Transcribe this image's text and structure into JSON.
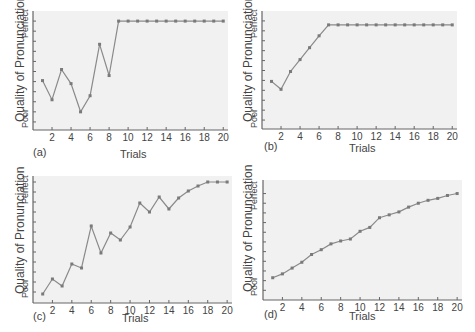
{
  "figure": {
    "ylabel": "Quality of Pronunciation",
    "ytop_label": "Perfect",
    "ybottom_label": "Poor",
    "xlabel": "Trials",
    "xtick_labels": [
      "2",
      "4",
      "6",
      "8",
      "10",
      "12",
      "14",
      "16",
      "18",
      "20"
    ],
    "colors": {
      "plot_bg": "#f1f1f1",
      "line": "#8a8a8a",
      "marker": "#7a7a7a",
      "axis": "#666666"
    }
  },
  "panels": [
    {
      "tag": "(a)"
    },
    {
      "tag": "(b)"
    },
    {
      "tag": "(c)"
    },
    {
      "tag": "(d)"
    }
  ],
  "chart_data": [
    {
      "type": "line",
      "title": "(a)",
      "xlabel": "Trials",
      "ylabel": "Quality of Pronunciation (Poor → Perfect)",
      "x": [
        1,
        2,
        3,
        4,
        5,
        6,
        7,
        8,
        9,
        10,
        11,
        12,
        13,
        14,
        15,
        16,
        17,
        18,
        19,
        20
      ],
      "values": [
        4.1,
        2.2,
        5.2,
        3.8,
        1.0,
        2.6,
        7.7,
        4.6,
        10,
        10,
        10,
        10,
        10,
        10,
        10,
        10,
        10,
        10,
        10,
        10
      ],
      "xlim": [
        0,
        20.5
      ],
      "ylim": [
        -0.8,
        11
      ],
      "y_ticks_count": 11,
      "grid": false
    },
    {
      "type": "line",
      "title": "(b)",
      "xlabel": "Trials",
      "ylabel": "Quality of Pronunciation (Poor → Perfect)",
      "x": [
        1,
        2,
        3,
        4,
        5,
        6,
        7,
        8,
        9,
        10,
        11,
        12,
        13,
        14,
        15,
        16,
        17,
        18,
        19,
        20
      ],
      "values": [
        3.9,
        3.1,
        4.9,
        6.1,
        7.3,
        8.5,
        9.6,
        9.6,
        9.6,
        9.6,
        9.6,
        9.6,
        9.6,
        9.6,
        9.6,
        9.6,
        9.6,
        9.6,
        9.6,
        9.6
      ],
      "xlim": [
        0,
        20.5
      ],
      "ylim": [
        -0.9,
        11
      ],
      "y_ticks_count": 11,
      "grid": false
    },
    {
      "type": "line",
      "title": "(c)",
      "xlabel": "Trials",
      "ylabel": "Quality of Pronunciation (Poor → Perfect)",
      "x": [
        1,
        2,
        3,
        4,
        5,
        6,
        7,
        8,
        9,
        10,
        11,
        12,
        13,
        14,
        15,
        16,
        17,
        18,
        19,
        20
      ],
      "values": [
        -0.2,
        1.3,
        0.6,
        2.8,
        2.4,
        6.6,
        3.9,
        5.9,
        5.2,
        6.5,
        8.9,
        8.0,
        9.5,
        8.3,
        9.4,
        10.1,
        10.6,
        11,
        11,
        11
      ],
      "xlim": [
        0,
        20.5
      ],
      "ylim": [
        -1.1,
        11.6
      ],
      "y_ticks_count": 12,
      "grid": false
    },
    {
      "type": "line",
      "title": "(d)",
      "xlabel": "Trials",
      "ylabel": "Quality of Pronunciation (Poor → Perfect)",
      "x": [
        1,
        2,
        3,
        4,
        5,
        6,
        7,
        8,
        9,
        10,
        11,
        12,
        13,
        14,
        15,
        16,
        17,
        18,
        19,
        20
      ],
      "values": [
        1.3,
        1.7,
        2.3,
        2.9,
        3.7,
        4.2,
        4.8,
        5.1,
        5.3,
        6.1,
        6.5,
        7.5,
        7.8,
        8.1,
        8.6,
        9.0,
        9.3,
        9.5,
        9.8,
        10.0
      ],
      "xlim": [
        0,
        20.5
      ],
      "ylim": [
        -1.0,
        11.4
      ],
      "y_ticks_count": 11,
      "grid": false
    }
  ]
}
